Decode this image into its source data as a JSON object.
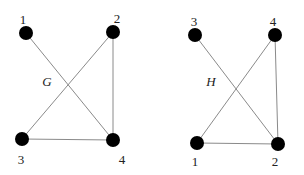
{
  "graphs": [
    {
      "name": "G",
      "name_pos": [
        47,
        86
      ],
      "nodes": [
        {
          "label": "1",
          "x": 26,
          "y": 33,
          "lx": 23,
          "ly": 24
        },
        {
          "label": "2",
          "x": 113,
          "y": 32,
          "lx": 117,
          "ly": 23
        },
        {
          "label": "3",
          "x": 22,
          "y": 139,
          "lx": 21,
          "ly": 164
        },
        {
          "label": "4",
          "x": 113,
          "y": 140,
          "lx": 122,
          "ly": 164
        }
      ],
      "edges": [
        [
          "1",
          "4"
        ],
        [
          "2",
          "3"
        ],
        [
          "2",
          "4"
        ],
        [
          "3",
          "4"
        ]
      ]
    },
    {
      "name": "H",
      "name_pos": [
        211,
        86
      ],
      "nodes": [
        {
          "label": "3",
          "x": 195,
          "y": 35,
          "lx": 194,
          "ly": 26
        },
        {
          "label": "4",
          "x": 275,
          "y": 35,
          "lx": 273,
          "ly": 26
        },
        {
          "label": "1",
          "x": 197,
          "y": 143,
          "lx": 195,
          "ly": 166
        },
        {
          "label": "2",
          "x": 278,
          "y": 144,
          "lx": 275,
          "ly": 166
        }
      ],
      "edges": [
        [
          "3",
          "2"
        ],
        [
          "4",
          "1"
        ],
        [
          "4",
          "2"
        ],
        [
          "1",
          "2"
        ]
      ]
    }
  ],
  "style": {
    "node_color": "#000000",
    "edge_color": "#8a8a8a",
    "node_radius": 7
  }
}
